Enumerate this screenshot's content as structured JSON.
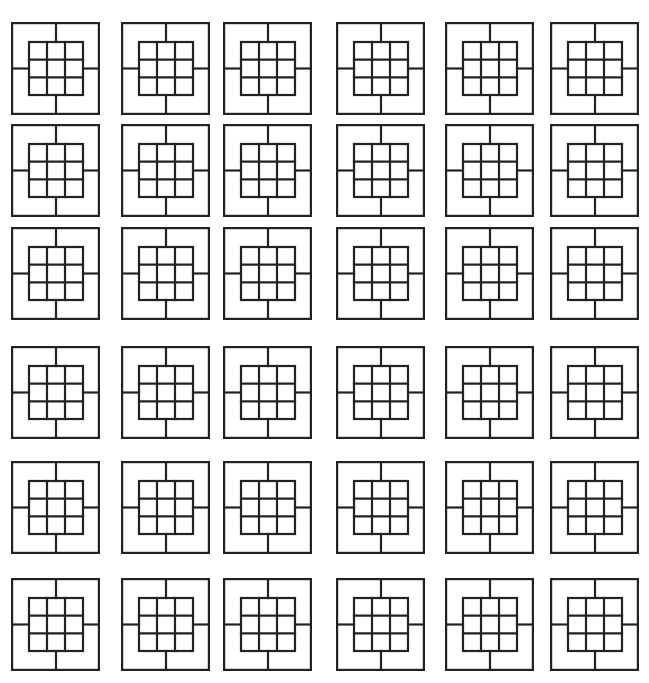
{
  "figure": {
    "rows": 6,
    "cols": 6,
    "stroke_color": "#222222",
    "background": "#ffffff",
    "col_x": [
      11,
      121,
      223,
      336,
      445,
      550
    ],
    "row_y": [
      22,
      124,
      227,
      346,
      461,
      578
    ]
  }
}
